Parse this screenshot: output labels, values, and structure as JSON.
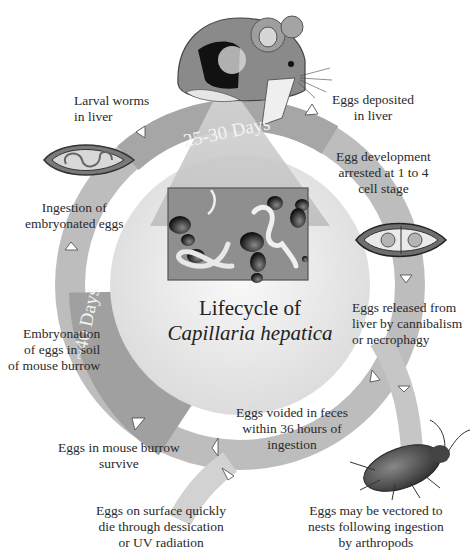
{
  "diagram": {
    "title_line1": "Lifecycle of",
    "title_species": "Capillaria hepatica",
    "phases": {
      "top_duration": "25-30 Days",
      "left_duration": "~40 Days"
    },
    "stages": [
      {
        "id": "larval",
        "lines": [
          "Larval worms",
          "in liver"
        ]
      },
      {
        "id": "deposited",
        "lines": [
          "Eggs deposited",
          "in liver"
        ]
      },
      {
        "id": "arrested",
        "lines": [
          "Egg development",
          "arrested at 1 to 4",
          "cell stage"
        ]
      },
      {
        "id": "ingestion",
        "lines": [
          "Ingestion of",
          "embryonated eggs"
        ]
      },
      {
        "id": "released",
        "lines": [
          "Eggs released from",
          "liver by cannibalism",
          "or necrophagy"
        ]
      },
      {
        "id": "embryonation",
        "lines": [
          "Embryonation",
          "of eggs in soil",
          "of mouse burrow"
        ]
      },
      {
        "id": "voided",
        "lines": [
          "Eggs voided in feces",
          "within 36 hours of",
          "ingestion"
        ]
      },
      {
        "id": "burrow",
        "lines": [
          "Eggs in mouse burrow",
          "survive"
        ]
      },
      {
        "id": "surface",
        "lines": [
          "Eggs on surface quickly",
          "die through dessication",
          "or UV radiation"
        ]
      },
      {
        "id": "vectored",
        "lines": [
          "Eggs may be vectored to",
          "nests following ingestion",
          "by arthropods"
        ]
      }
    ],
    "colors": {
      "ring": "#b8b8b8",
      "ring_dark": "#9a9a9a",
      "center": "#eeeeee",
      "panel": "#8f8f8f",
      "text": "#2a2a2a"
    }
  }
}
